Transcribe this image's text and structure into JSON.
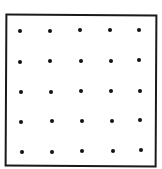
{
  "diagram": {
    "type": "dot-grid",
    "rows": 5,
    "cols": 5,
    "border_color": "#1a1a1a",
    "dot_color": "#111111",
    "dots": [
      {
        "x": 20,
        "y": 31
      },
      {
        "x": 50,
        "y": 31
      },
      {
        "x": 80,
        "y": 30
      },
      {
        "x": 110,
        "y": 30
      },
      {
        "x": 139,
        "y": 30
      },
      {
        "x": 20,
        "y": 62
      },
      {
        "x": 50,
        "y": 61
      },
      {
        "x": 81,
        "y": 61
      },
      {
        "x": 111,
        "y": 61
      },
      {
        "x": 139,
        "y": 60
      },
      {
        "x": 21,
        "y": 92
      },
      {
        "x": 51,
        "y": 92
      },
      {
        "x": 81,
        "y": 91
      },
      {
        "x": 111,
        "y": 91
      },
      {
        "x": 140,
        "y": 91
      },
      {
        "x": 21,
        "y": 122
      },
      {
        "x": 52,
        "y": 121
      },
      {
        "x": 82,
        "y": 121
      },
      {
        "x": 112,
        "y": 121
      },
      {
        "x": 140,
        "y": 120
      },
      {
        "x": 22,
        "y": 152
      },
      {
        "x": 52,
        "y": 152
      },
      {
        "x": 82,
        "y": 151
      },
      {
        "x": 113,
        "y": 151
      },
      {
        "x": 141,
        "y": 150
      }
    ]
  }
}
